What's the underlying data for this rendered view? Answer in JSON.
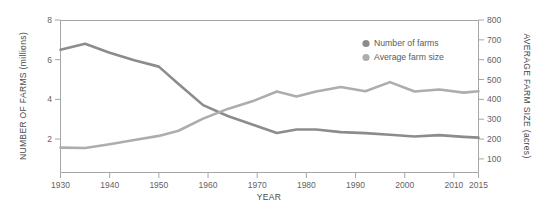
{
  "chart_data": {
    "type": "line",
    "title": "",
    "subtitle": "",
    "xlabel": "YEAR",
    "ylabel": "NUMBER OF FARMS (millions)",
    "y2label": "AVERAGE FARM SIZE (acres)",
    "grid": false,
    "legend_position": "upper-right",
    "xlim": [
      1930,
      2015
    ],
    "xticks": [
      1930,
      1940,
      1950,
      1960,
      1970,
      1980,
      1990,
      2000,
      2010,
      2015
    ],
    "xticklabels": [
      "1930",
      "1940",
      "1950",
      "1960",
      "1970",
      "1980",
      "1990",
      "2000",
      "2010",
      "2015"
    ],
    "ylim": [
      0.34,
      8
    ],
    "yticks": [
      2,
      4,
      6,
      8
    ],
    "yticklabels": [
      "2",
      "4",
      "6",
      "8"
    ],
    "y2lim": [
      34,
      800
    ],
    "y2ticks": [
      100,
      200,
      300,
      400,
      500,
      600,
      700,
      800
    ],
    "y2ticklabels": [
      "100",
      "200",
      "300",
      "400",
      "500",
      "600",
      "700",
      "800"
    ],
    "series": [
      {
        "name": "Number of farms",
        "axis": "left",
        "color": "#8c8c8c",
        "unit": "millions",
        "x": [
          1930,
          1935,
          1940,
          1945,
          1950,
          1954,
          1959,
          1964,
          1969,
          1974,
          1978,
          1982,
          1987,
          1992,
          1997,
          2002,
          2007,
          2012,
          2015
        ],
        "values": [
          6.5,
          6.8,
          6.35,
          5.97,
          5.65,
          4.78,
          3.71,
          3.16,
          2.73,
          2.31,
          2.48,
          2.48,
          2.35,
          2.3,
          2.22,
          2.13,
          2.2,
          2.11,
          2.07
        ]
      },
      {
        "name": "Average farm size",
        "axis": "right",
        "color": "#adadad",
        "unit": "acres",
        "x": [
          1930,
          1935,
          1940,
          1945,
          1950,
          1954,
          1959,
          1964,
          1969,
          1974,
          1978,
          1982,
          1987,
          1992,
          1997,
          2002,
          2007,
          2012,
          2015
        ],
        "values": [
          157,
          155,
          174,
          195,
          216,
          242,
          303,
          352,
          390,
          440,
          415,
          440,
          462,
          441,
          487,
          440,
          450,
          434,
          441
        ]
      }
    ],
    "crossover": {
      "year": 1962,
      "farms_millions": 3.5,
      "size_acres": 350
    },
    "legend": [
      {
        "label": "Number of farms",
        "color": "#8c8c8c"
      },
      {
        "label": "Average farm size",
        "color": "#adadad"
      }
    ]
  }
}
